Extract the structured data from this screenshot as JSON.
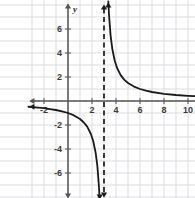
{
  "figure": {
    "name": "rational-function-graph",
    "background_color": "#ffffff",
    "grid_color": "#d9d9e0",
    "axis_color": "#555555",
    "curve_color": "#1a1a1a",
    "asymptote_color": "#1a1a1a"
  },
  "chart_data": {
    "type": "line",
    "title": "",
    "subtitle": "",
    "xlabel": "x",
    "ylabel": "y",
    "xlim": [
      -3.3,
      11.5
    ],
    "ylim": [
      -8.2,
      8.2
    ],
    "grid": true,
    "grid_step": 1,
    "legend": "none",
    "x_ticks": [
      -2,
      2,
      4,
      6,
      8,
      10
    ],
    "x_tick_labels": [
      "-2",
      "2",
      "4",
      "6",
      "8",
      "10"
    ],
    "y_ticks": [
      -6,
      -4,
      -2,
      2,
      4,
      6
    ],
    "y_tick_labels": [
      "-6",
      "-4",
      "-2",
      "2",
      "4",
      "6"
    ],
    "asymptotes": [
      {
        "kind": "vertical",
        "value": 3,
        "style": "dashed",
        "label": "x = 3"
      },
      {
        "kind": "horizontal",
        "value": 0,
        "style": "none",
        "label": "y = 0"
      }
    ],
    "function": "y = 3 / (x - 3)",
    "series": [
      {
        "name": "left-branch",
        "style": "solid",
        "points": [
          [
            -3.3,
            -0.48
          ],
          [
            -3.0,
            -0.5
          ],
          [
            -2.5,
            -0.55
          ],
          [
            -2.0,
            -0.6
          ],
          [
            -1.5,
            -0.67
          ],
          [
            -1.0,
            -0.75
          ],
          [
            -0.5,
            -0.86
          ],
          [
            0.0,
            -1.0
          ],
          [
            0.5,
            -1.2
          ],
          [
            1.0,
            -1.5
          ],
          [
            1.3,
            -1.77
          ],
          [
            1.6,
            -2.14
          ],
          [
            1.9,
            -2.73
          ],
          [
            2.1,
            -3.33
          ],
          [
            2.3,
            -4.29
          ],
          [
            2.45,
            -5.45
          ],
          [
            2.58,
            -7.14
          ],
          [
            2.64,
            -8.3
          ]
        ]
      },
      {
        "name": "right-branch",
        "style": "solid",
        "points": [
          [
            3.36,
            8.3
          ],
          [
            3.42,
            7.14
          ],
          [
            3.55,
            5.45
          ],
          [
            3.7,
            4.29
          ],
          [
            3.9,
            3.33
          ],
          [
            4.1,
            2.73
          ],
          [
            4.4,
            2.14
          ],
          [
            4.7,
            1.76
          ],
          [
            5.0,
            1.5
          ],
          [
            5.5,
            1.2
          ],
          [
            6.0,
            1.0
          ],
          [
            6.5,
            0.86
          ],
          [
            7.0,
            0.75
          ],
          [
            8.0,
            0.6
          ],
          [
            9.0,
            0.5
          ],
          [
            10.0,
            0.43
          ],
          [
            11.0,
            0.38
          ],
          [
            11.5,
            0.36
          ]
        ]
      }
    ],
    "arrows": [
      {
        "name": "x-axis-arrow-right",
        "at": [
          11.5,
          0
        ]
      },
      {
        "name": "x-axis-arrow-left",
        "at": [
          -3.3,
          0
        ]
      },
      {
        "name": "y-axis-arrow-up",
        "at": [
          0,
          8.2
        ]
      },
      {
        "name": "y-axis-arrow-down",
        "at": [
          0,
          -8.2
        ]
      },
      {
        "name": "left-branch-arrow-left",
        "at": [
          -3.3,
          -0.48
        ]
      },
      {
        "name": "left-branch-arrow-down",
        "at": [
          2.64,
          -8.3
        ]
      },
      {
        "name": "right-branch-arrow-up",
        "at": [
          3.36,
          8.3
        ]
      },
      {
        "name": "right-branch-arrow-right",
        "at": [
          11.5,
          0.36
        ]
      },
      {
        "name": "asymptote-arrow-up",
        "at": [
          3,
          8.3
        ]
      },
      {
        "name": "asymptote-arrow-down",
        "at": [
          3,
          -8.3
        ]
      }
    ]
  }
}
